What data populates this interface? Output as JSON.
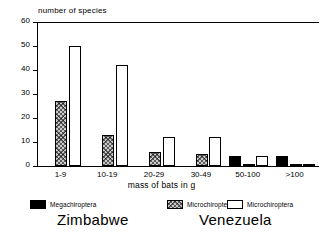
{
  "chart_data": {
    "type": "bar",
    "title": "",
    "ylabel": "number of species",
    "xlabel": "mass of bats in g",
    "categories": [
      "1-9",
      "10-19",
      "20-29",
      "30-49",
      "50-100",
      ">100"
    ],
    "ylim": [
      0,
      60
    ],
    "yticks": [
      0,
      10,
      20,
      30,
      40,
      50,
      60
    ],
    "grid": false,
    "legend_position": "bottom",
    "series": [
      {
        "name": "Megachiroptera",
        "region": "Zimbabwe",
        "color": "#000000",
        "values": [
          0,
          0,
          0,
          0,
          4,
          4
        ]
      },
      {
        "name": "Microchiroptera",
        "region": "Zimbabwe",
        "color": "#c9c9c9",
        "values": [
          27,
          13,
          6,
          5,
          1,
          1
        ]
      },
      {
        "name": "Microchiroptera",
        "region": "Venezuela",
        "color": "#ffffff",
        "values": [
          50,
          42,
          12,
          12,
          4,
          1
        ]
      }
    ]
  },
  "axes": {
    "y_title": "number of species",
    "x_title": "mass of bats in g",
    "y_tick_labels": [
      "60",
      "50",
      "40",
      "30",
      "20",
      "10",
      "0"
    ],
    "x_tick_labels": [
      "1-9",
      "10-19",
      "20-29",
      "30-49",
      "50-100",
      ">100"
    ]
  },
  "legend": {
    "entries": [
      {
        "label": "Megachiroptera",
        "swatch": "solid-black-swatch"
      },
      {
        "label": "Microchiroptera",
        "swatch": "hatched-gray-swatch"
      },
      {
        "label": "Microchiroptera",
        "swatch": "outline-white-swatch"
      }
    ]
  },
  "captions": {
    "left": "Zimbabwe",
    "right": "Venezuela"
  }
}
